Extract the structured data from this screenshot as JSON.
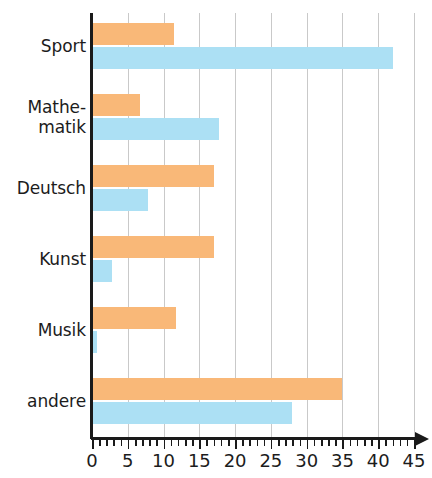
{
  "chart_data": {
    "type": "bar",
    "orientation": "horizontal",
    "title": "",
    "subtitle": "",
    "xlabel": "",
    "ylabel": "",
    "xlim": [
      0,
      45
    ],
    "grid": true,
    "grid_axis": "x",
    "legend": "none",
    "categories": [
      "Sport",
      "Mathe-matik",
      "Deutsch",
      "Kunst",
      "Musik",
      "andere"
    ],
    "category_lines": [
      [
        "Sport"
      ],
      [
        "Mathe-",
        "matik"
      ],
      [
        "Deutsch"
      ],
      [
        "Kunst"
      ],
      [
        "Musik"
      ],
      [
        "andere"
      ]
    ],
    "series": [
      {
        "name": "orange",
        "color": "#f9b878",
        "values": [
          11.5,
          6.7,
          17,
          17,
          11.8,
          35
        ]
      },
      {
        "name": "blue",
        "color": "#ace0f4",
        "values": [
          42,
          17.8,
          7.8,
          2.8,
          0.7,
          28
        ]
      }
    ],
    "xticks": [
      0,
      5,
      10,
      15,
      20,
      25,
      30,
      35,
      40,
      45
    ],
    "xtick_labels": [
      "0",
      "5",
      "10",
      "15",
      "20",
      "25",
      "30",
      "35",
      "40",
      "45"
    ],
    "minor_tick_step": 1,
    "gridlines_at": [
      5,
      10,
      15,
      20,
      25,
      30,
      35,
      40,
      45
    ],
    "axis_color": "#1a1a1a",
    "grid_color": "#c9c9c9",
    "background_color": "#ffffff"
  }
}
